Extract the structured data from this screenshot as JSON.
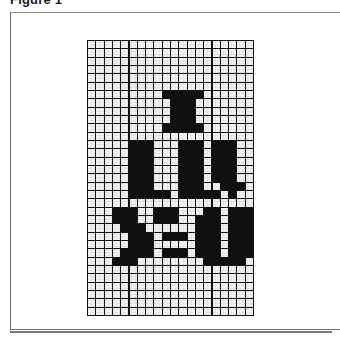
{
  "figure": {
    "caption": "Figure 1"
  },
  "card": {
    "background_color": "#ffffff",
    "border_color": "#6e6e6e"
  },
  "grid": {
    "name": "pixel-art-grid",
    "columns": 20,
    "rows": 33,
    "cell_on_color": "#111111",
    "cell_off_color": "#f2f2f0",
    "line_color": "#111111",
    "message": "I LUV YOU",
    "message_lines": [
      "I",
      "LUV",
      "YOU"
    ],
    "pattern": [
      "00000000000000000000",
      "00000000000000000000",
      "00000000000000000000",
      "00000000000000000000",
      "00000000000000000000",
      "00000000000000000000",
      "00000000011111000000",
      "00000000001110000000",
      "00000000001110000000",
      "00000000001110000000",
      "00000000011111000000",
      "00000000000000000000",
      "00000111000111011100",
      "00000111000111011100",
      "00000111000111011100",
      "00000111000111011100",
      "00000111000111011100",
      "00000111000111001110",
      "00000111110111110100",
      "00000000000000000000",
      "00011100111000110111",
      "00011100111001110111",
      "00001110000001110111",
      "00000111011101110111",
      "00000111000001110111",
      "00001111011101110111",
      "00011100000000111110",
      "00000000000000000000",
      "00000000000000000000",
      "00000000000000000000",
      "00000000000000000000",
      "00000000000000000000",
      "00000000000000000000"
    ]
  }
}
